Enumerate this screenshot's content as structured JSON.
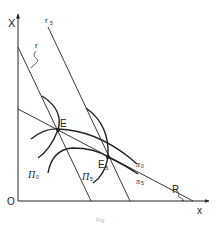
{
  "diagram": {
    "axes": {
      "y_label": "X",
      "x_label": "x",
      "origin_label": "O"
    },
    "lines": [
      {
        "id": "r",
        "label": "r",
        "from": [
          18,
          47
        ],
        "to": [
          91,
          201
        ]
      },
      {
        "id": "r5",
        "label": "r",
        "sub": "5",
        "from": [
          48,
          27
        ],
        "to": [
          130,
          201
        ]
      },
      {
        "id": "R",
        "label": "R",
        "from": [
          18,
          109
        ],
        "to": [
          193,
          201
        ]
      }
    ],
    "points": [
      {
        "id": "E",
        "label": "E",
        "x": 58,
        "y": 130
      },
      {
        "id": "E5",
        "label": "E",
        "sub": "5",
        "x": 108,
        "y": 157
      }
    ],
    "curves": [
      {
        "id": "Pi0",
        "label": "Π",
        "sub": "0"
      },
      {
        "id": "Pi5",
        "label": "Π",
        "sub": "5"
      },
      {
        "id": "pi0",
        "label": "π",
        "sub": "0"
      },
      {
        "id": "pi5",
        "label": "π",
        "sub": "5"
      }
    ],
    "caption": "Fig."
  }
}
